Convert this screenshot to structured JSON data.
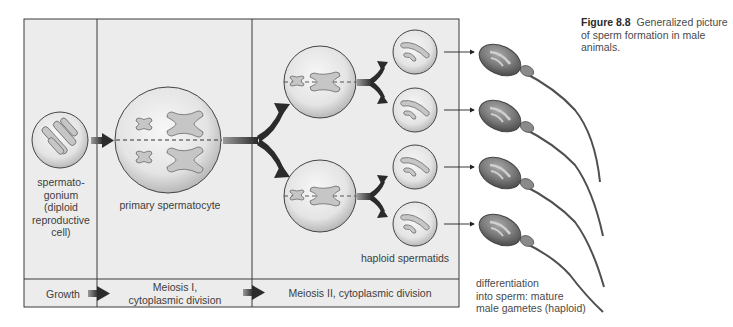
{
  "figure": {
    "number": "Figure 8.8",
    "caption": "Generalized picture of sperm formation in male animals."
  },
  "stages": {
    "spermatogonium": {
      "lines": [
        "spermato-",
        "gonium",
        "(diploid",
        "reproductive",
        "cell)"
      ]
    },
    "primary_spermatocyte": "primary spermatocyte",
    "haploid_spermatids": "haploid spermatids",
    "sperm": {
      "lines": [
        "differentiation",
        "into sperm: mature",
        "male gametes (haploid)"
      ]
    }
  },
  "phase_band": {
    "growth": "Growth",
    "meiosis1": [
      "Meiosis I,",
      "cytoplasmic division"
    ],
    "meiosis2": "Meiosis II, cytoplasmic division"
  },
  "colors": {
    "panel_bg": "#ececec",
    "frame_line": "#3a3a3a",
    "cell_fill": "#e2e2e2",
    "chromosome_fill": "#c4c4c4",
    "arrow_dark": "#2b2b2b",
    "sperm_fill": "#7d7d7d"
  }
}
